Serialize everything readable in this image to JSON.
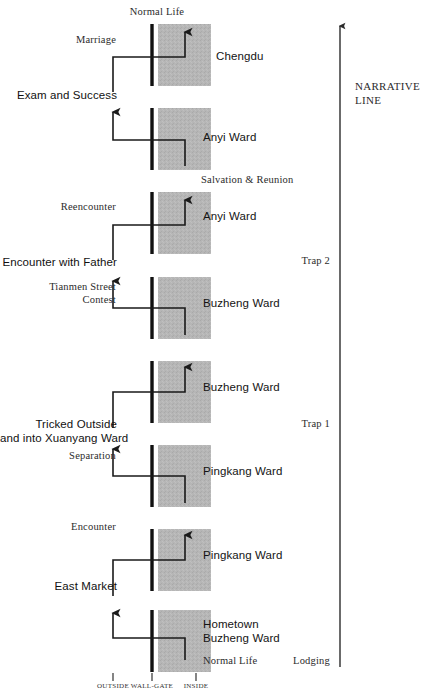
{
  "meta": {
    "type": "narrative-spatial-diagram",
    "colors": {
      "ink": "#1a1a1a",
      "band_fill": "#b5b5b5",
      "wall": "#111111",
      "connector": "#1a1a1a",
      "axis": "#333333"
    }
  },
  "narrative_axis": {
    "label_line1": "NARRATIVE",
    "label_line2": "LINE",
    "direction": "upward"
  },
  "x_axis": {
    "ticks": [
      {
        "label": "OUTSIDE"
      },
      {
        "label": "WALL-GATE"
      },
      {
        "label": "INSIDE"
      }
    ]
  },
  "top_label": {
    "text": "Normal Life"
  },
  "phase_markers": [
    {
      "label": "Trap 2"
    },
    {
      "label": "Trap 1"
    },
    {
      "label": "Lodging"
    }
  ],
  "segments": [
    {
      "index": 1,
      "place": "Chengdu",
      "place_lines": [
        "Chengdu"
      ],
      "event_outside": "Marriage",
      "event_outside_lines": [
        "Marriage"
      ],
      "event_below": "Exam and Success",
      "inner_note": "Normal Life",
      "direction": "inward"
    },
    {
      "index": 2,
      "place": "Anyi Ward",
      "place_lines": [
        "Anyi Ward"
      ],
      "event_outside": "",
      "event_below": "",
      "inner_note": "Salvation & Reunion",
      "direction": "outward"
    },
    {
      "index": 3,
      "place": "Anyi Ward",
      "place_lines": [
        "Anyi Ward"
      ],
      "event_outside": "Reencounter",
      "event_outside_lines": [
        "Reencounter"
      ],
      "event_below": "Encounter with Father",
      "inner_note": "",
      "direction": "inward"
    },
    {
      "index": 4,
      "place": "Buzheng Ward",
      "place_lines": [
        "Buzheng Ward"
      ],
      "event_outside": "Tianmen Street Contest",
      "event_outside_lines": [
        "Tianmen Street",
        "Contest"
      ],
      "event_below": "",
      "inner_note": "",
      "direction": "outward"
    },
    {
      "index": 5,
      "place": "Buzheng Ward",
      "place_lines": [
        "Buzheng Ward"
      ],
      "event_outside": "",
      "event_below": "Tricked Outside and into Xuanyang Ward",
      "event_below_lines": [
        "Tricked Outside",
        "and into Xuanyang Ward"
      ],
      "inner_note": "",
      "direction": "inward"
    },
    {
      "index": 6,
      "place": "Pingkang Ward",
      "place_lines": [
        "Pingkang Ward"
      ],
      "event_outside": "Separation",
      "event_outside_lines": [
        "Separation"
      ],
      "event_below": "",
      "inner_note": "",
      "direction": "outward"
    },
    {
      "index": 7,
      "place": "Pingkang Ward",
      "place_lines": [
        "Pingkang Ward"
      ],
      "event_outside": "Encounter",
      "event_outside_lines": [
        "Encounter"
      ],
      "event_below": "East Market",
      "inner_note": "",
      "direction": "inward"
    },
    {
      "index": 8,
      "place": "Hometown Buzheng Ward",
      "place_lines": [
        "Hometown",
        "Buzheng Ward"
      ],
      "event_outside": "",
      "event_below": "",
      "inner_note": "Normal Life",
      "direction": "outward"
    }
  ]
}
